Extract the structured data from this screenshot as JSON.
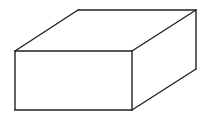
{
  "diagram": {
    "type": "cuboid-line-drawing",
    "colors": {
      "background": "#ffffff",
      "stroke": "#222222"
    },
    "vertices": {
      "front_top_left": [
        15,
        51
      ],
      "front_top_right": [
        132,
        51
      ],
      "front_bottom_right": [
        132,
        110
      ],
      "front_bottom_left": [
        15,
        110
      ],
      "back_top_left": [
        78,
        10
      ],
      "back_top_right": [
        196,
        10
      ],
      "back_bottom_right": [
        196,
        69
      ]
    },
    "faces": [
      "front",
      "top",
      "right"
    ],
    "labels": []
  }
}
